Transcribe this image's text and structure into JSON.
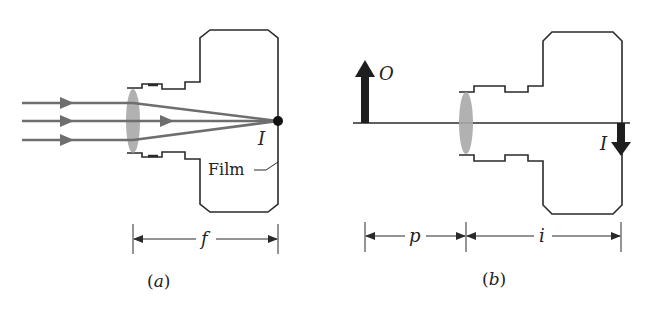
{
  "figure": {
    "panel_a": {
      "caption": "(a)",
      "image_label": "I",
      "film_label": "Film",
      "dimension_label": "f",
      "rays": 3
    },
    "panel_b": {
      "caption": "(b)",
      "object_label": "O",
      "image_label": "I",
      "object_distance_label": "p",
      "image_distance_label": "i"
    },
    "colors": {
      "outline": "#2a2a2a",
      "ray": "#6e6e6e",
      "lens": "#a8a8a8",
      "arrow": "#1e1e1e"
    }
  }
}
